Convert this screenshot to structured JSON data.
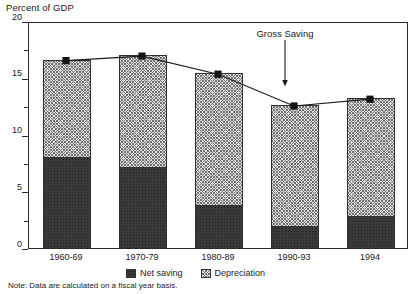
{
  "chart_data": {
    "type": "bar",
    "title": "",
    "subtitle": "",
    "ylabel": "Percent of GDP",
    "xlabel": "",
    "ylim": [
      0,
      20
    ],
    "yticks": [
      0,
      5,
      10,
      15,
      20
    ],
    "ytick_labels": [
      "0",
      "5",
      "10",
      "15",
      "20"
    ],
    "yminor_ticks": [
      2.5,
      7.5,
      12.5,
      17.5
    ],
    "grid": false,
    "stacked": true,
    "categories": [
      "1960-69",
      "1970-79",
      "1980-89",
      "1990-93",
      "1994"
    ],
    "series": [
      {
        "name": "Net saving",
        "values": [
          8.0,
          7.1,
          3.8,
          1.9,
          2.8
        ]
      },
      {
        "name": "Depreciation",
        "values": [
          8.6,
          9.9,
          11.6,
          10.7,
          10.4
        ]
      }
    ],
    "overlay_series": {
      "name": "Gross Saving",
      "marker": "square",
      "values": [
        16.6,
        17.0,
        15.4,
        12.6,
        13.2
      ]
    },
    "annotations": [
      {
        "text": "Gross Saving",
        "target_category": "1990-93",
        "style": "arrow-down"
      }
    ],
    "legend": {
      "position": "bottom",
      "entries": [
        {
          "label": "Net saving",
          "swatch": "dark-dotted"
        },
        {
          "label": "Depreciation",
          "swatch": "light-crosshatch"
        }
      ]
    },
    "footnote": "Note: Data are calculated on a fiscal year basis.",
    "colors": {
      "net_saving": "#3a3a3a",
      "depreciation": "#e2e2e2",
      "axis": "#2a2a2a",
      "line": "#1a1a1a",
      "marker": "#141414"
    }
  }
}
